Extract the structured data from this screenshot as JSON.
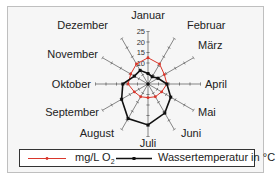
{
  "chart_data": {
    "type": "radar",
    "categories": [
      "Januar",
      "Februar",
      "März",
      "April",
      "Mai",
      "Juni",
      "Juli",
      "August",
      "September",
      "Oktober",
      "November",
      "Dezember"
    ],
    "series": [
      {
        "name": "mg/L O2",
        "color": "#d9362b",
        "values": [
          12.5,
          11,
          9,
          9,
          7.5,
          7,
          6.5,
          7,
          7.5,
          9.5,
          9.5,
          11
        ]
      },
      {
        "name": "Wassertemperatur in °C",
        "color": "#111111",
        "values": [
          5,
          4,
          5.5,
          9,
          12.5,
          16,
          19.5,
          19,
          14.5,
          12,
          7.5,
          7.5
        ]
      }
    ],
    "radial_ticks": [
      5,
      10,
      15,
      20,
      25
    ],
    "radial_tick_labels": [
      "10",
      "15",
      "20",
      "25"
    ],
    "rlim": [
      0,
      30
    ],
    "grid": false,
    "legend_position": "bottom"
  },
  "legend": {
    "o2_label": "mg/L O",
    "o2_sub": "2",
    "temp_label": "Wassertemperatur  in °C"
  }
}
